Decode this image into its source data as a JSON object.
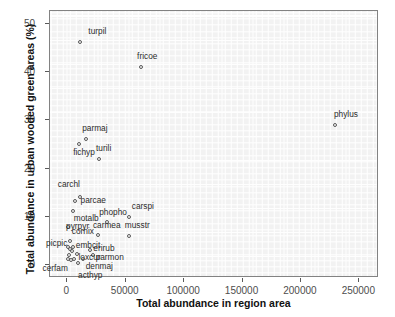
{
  "chart_data": {
    "type": "scatter",
    "title": "",
    "xlabel": "Total abundance in region area",
    "ylabel": "Total abundance in urban wooded green areas (%)",
    "xlim": [
      -14000,
      266000
    ],
    "ylim": [
      -2.5,
      52.5
    ],
    "xticks": [
      0,
      50000,
      100000,
      150000,
      200000,
      250000
    ],
    "xticklabels": [
      "0",
      "50000",
      "100000",
      "150000",
      "200000",
      "250000"
    ],
    "yticks": [
      0,
      10,
      20,
      30,
      40,
      50
    ],
    "yticklabels": [
      "0",
      "10",
      "20",
      "30",
      "40",
      "50"
    ],
    "grid": true,
    "legend": false,
    "marker": "open-circle",
    "panel_color": "#f2f2f2",
    "grid_color": "#ffffff",
    "marker_color": "#595959",
    "points": [
      {
        "label": "turpil",
        "x": 12000,
        "y": 46.0,
        "lx": 8,
        "ly": -11
      },
      {
        "label": "fricoe",
        "x": 64000,
        "y": 40.8,
        "lx": -4,
        "ly": -11
      },
      {
        "label": "phylus",
        "x": 230000,
        "y": 28.8,
        "lx": -1,
        "ly": -11
      },
      {
        "label": "parmaj",
        "x": 17000,
        "y": 26.0,
        "lx": -4,
        "ly": -11
      },
      {
        "label": "fichyp",
        "x": 11000,
        "y": 25.0,
        "lx": -6,
        "ly": 8
      },
      {
        "label": "turili",
        "x": 28000,
        "y": 21.8,
        "lx": -3,
        "ly": -11
      },
      {
        "label": "carchl",
        "x": 11500,
        "y": 14.0,
        "lx": -22,
        "ly": -13
      },
      {
        "label": "parcae",
        "x": 7000,
        "y": 13.0,
        "lx": 6,
        "ly": -1
      },
      {
        "label": "motalb",
        "x": 5500,
        "y": 11.0,
        "lx": 1,
        "ly": 7
      },
      {
        "label": "carspi",
        "x": 53500,
        "y": 9.8,
        "lx": 3,
        "ly": -11
      },
      {
        "label": "phopho",
        "x": 35000,
        "y": 8.8,
        "lx": -8,
        "ly": -10
      },
      {
        "label": "pyrpyr",
        "x": 1500,
        "y": 7.6,
        "lx": -2,
        "ly": -1
      },
      {
        "label": "carmea",
        "x": 27000,
        "y": 6.0,
        "lx": -5,
        "ly": -10
      },
      {
        "label": "musstr",
        "x": 53500,
        "y": 5.9,
        "lx": -4,
        "ly": -11
      },
      {
        "label": "cornix",
        "x": 3000,
        "y": 4.7,
        "lx": 2,
        "ly": -10
      },
      {
        "label": "picpic",
        "x": 1500,
        "y": 3.6,
        "lx": -22,
        "ly": -4
      },
      {
        "label": "embcit",
        "x": 5500,
        "y": 3.5,
        "lx": 3,
        "ly": -2
      },
      {
        "label": "erirub",
        "x": 20500,
        "y": 2.8,
        "lx": 3,
        "ly": -2
      },
      {
        "label": "parmon",
        "x": 22500,
        "y": 1.8,
        "lx": 3,
        "ly": 2
      },
      {
        "label": "loxcur",
        "x": 9500,
        "y": 2.0,
        "lx": 1,
        "ly": 3
      },
      {
        "label": "denmaj",
        "x": 14000,
        "y": 1.0,
        "lx": 3,
        "ly": 7
      },
      {
        "label": "cerfam",
        "x": 1000,
        "y": 1.0,
        "lx": -25,
        "ly": 9
      },
      {
        "label": "acthyp",
        "x": 10000,
        "y": 0.3,
        "lx": 0,
        "ly": 12
      },
      {
        "label": "",
        "x": 3200,
        "y": 3.1,
        "lx": 0,
        "ly": 0
      },
      {
        "label": "",
        "x": 4600,
        "y": 2.6,
        "lx": 0,
        "ly": 0
      },
      {
        "label": "",
        "x": 2200,
        "y": 1.9,
        "lx": 0,
        "ly": 0
      },
      {
        "label": "",
        "x": 6500,
        "y": 1.1,
        "lx": 0,
        "ly": 0
      },
      {
        "label": "",
        "x": 4000,
        "y": 0.9,
        "lx": 0,
        "ly": 0
      }
    ]
  }
}
